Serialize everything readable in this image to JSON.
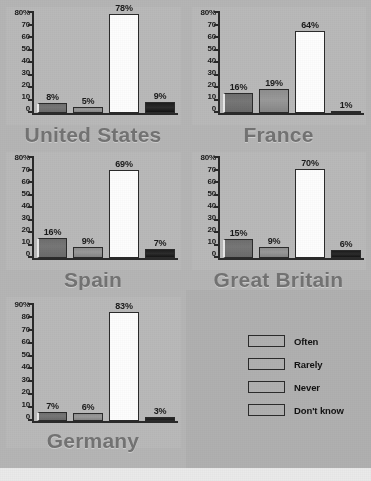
{
  "chart_data": {
    "type": "bar",
    "title": "",
    "xlabel": "",
    "ylabel": "",
    "grid": false,
    "legend_position": "bottom-right",
    "categories": [
      "Often",
      "Rarely",
      "Never",
      "Don't know"
    ],
    "panels": [
      {
        "name": "United States",
        "ylim": [
          0,
          80
        ],
        "yticks": [
          "80%",
          "70",
          "60",
          "50",
          "40",
          "30",
          "20",
          "10",
          "0"
        ],
        "values": [
          8,
          5,
          78,
          9
        ],
        "labels": [
          "8%",
          "5%",
          "78%",
          "9%"
        ]
      },
      {
        "name": "France",
        "ylim": [
          0,
          80
        ],
        "yticks": [
          "80%",
          "70",
          "60",
          "50",
          "40",
          "30",
          "20",
          "10",
          "0"
        ],
        "values": [
          16,
          19,
          64,
          1
        ],
        "labels": [
          "16%",
          "19%",
          "64%",
          "1%"
        ]
      },
      {
        "name": "Spain",
        "ylim": [
          0,
          80
        ],
        "yticks": [
          "80%",
          "70",
          "60",
          "50",
          "40",
          "30",
          "20",
          "10",
          "0"
        ],
        "values": [
          16,
          9,
          69,
          7
        ],
        "labels": [
          "16%",
          "9%",
          "69%",
          "7%"
        ]
      },
      {
        "name": "Great Britain",
        "ylim": [
          0,
          80
        ],
        "yticks": [
          "80%",
          "70",
          "60",
          "50",
          "40",
          "30",
          "20",
          "10",
          "0"
        ],
        "values": [
          15,
          9,
          70,
          6
        ],
        "labels": [
          "15%",
          "9%",
          "70%",
          "6%"
        ]
      },
      {
        "name": "Germany",
        "ylim": [
          0,
          90
        ],
        "yticks": [
          "90%",
          "80",
          "70",
          "60",
          "50",
          "40",
          "30",
          "20",
          "10",
          "0"
        ],
        "values": [
          7,
          6,
          83,
          3
        ],
        "labels": [
          "7%",
          "6%",
          "83%",
          "3%"
        ]
      }
    ],
    "legend": [
      {
        "label": "Often",
        "color": "#707070"
      },
      {
        "label": "Rarely",
        "color": "#929292"
      },
      {
        "label": "Never",
        "color": "#fdfdfd"
      },
      {
        "label": "Don't know",
        "color": "#1d1d1d"
      }
    ]
  }
}
